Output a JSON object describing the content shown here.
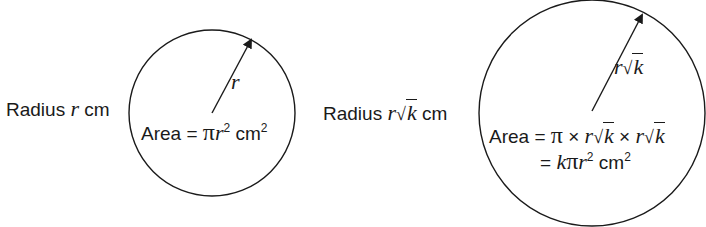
{
  "left_figure": {
    "label_prefix": "Radius",
    "label_var": "r",
    "label_unit": "cm",
    "radius_label": "r",
    "area_prefix": "Area =",
    "area_pi": "π",
    "area_var": "r",
    "area_exp": "2",
    "area_unit": "cm",
    "area_unit_exp": "2"
  },
  "right_figure": {
    "label_prefix": "Radius",
    "label_var": "r",
    "label_root_symbol": "√",
    "label_root_arg": "k",
    "label_unit": "cm",
    "radius_label_var": "r",
    "radius_label_root_symbol": "√",
    "radius_label_root_arg": "k",
    "area_line1_prefix": "Area =",
    "area_line1_pi": "π",
    "times": "×",
    "area_line1_var": "r",
    "area_line1_root_symbol": "√",
    "area_line1_root_arg": "k",
    "area_line2_eq": "=",
    "area_line2_k": "k",
    "area_line2_pi": "π",
    "area_line2_var": "r",
    "area_line2_exp": "2",
    "area_line2_unit": "cm",
    "area_line2_unit_exp": "2"
  },
  "colors": {
    "stroke": "#1a1a1a",
    "background": "#ffffff"
  }
}
